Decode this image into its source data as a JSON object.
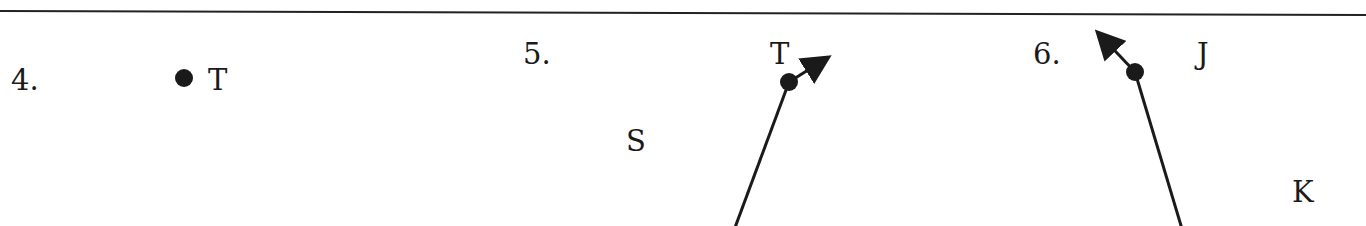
{
  "colors": {
    "ink": "#1a1a1a",
    "background": "#ffffff"
  },
  "problems": [
    {
      "number": "4.",
      "figure": "point",
      "points": [
        {
          "label": "T"
        }
      ]
    },
    {
      "number": "5.",
      "figure": "line",
      "points": [
        {
          "label": "S"
        },
        {
          "label": "T"
        }
      ],
      "arrows": "both ends"
    },
    {
      "number": "6.",
      "figure": "ray",
      "points": [
        {
          "label": "J"
        },
        {
          "label": "K"
        }
      ],
      "arrows": "one end (beyond J)"
    }
  ]
}
